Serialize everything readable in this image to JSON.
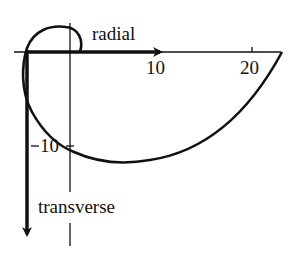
{
  "diagram": {
    "type": "orbit-trajectory-plot",
    "axes": {
      "horizontal": {
        "label": "radial",
        "ticks": [
          {
            "value": 10,
            "label": "10"
          },
          {
            "value": 20,
            "label": "20"
          }
        ]
      },
      "vertical": {
        "label": "transverse",
        "ticks": [
          {
            "value": 10,
            "label": "10"
          }
        ]
      }
    },
    "colors": {
      "ink": "#111111",
      "background": "#ffffff"
    }
  }
}
